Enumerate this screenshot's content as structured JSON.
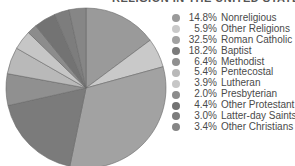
{
  "chart_data": {
    "type": "pie",
    "title": "RELIGION IN THE UNITED STATES",
    "legend_position": "right",
    "start_angle": "12 o'clock, clockwise",
    "slices": [
      {
        "label": "Nonreligious",
        "value": 14.8,
        "value_label": "14.8%",
        "color": "#9a9a9a"
      },
      {
        "label": "Other Religions",
        "value": 5.9,
        "value_label": "5.9%",
        "color": "#c9c9c9"
      },
      {
        "label": "Roman Catholic",
        "value": 32.5,
        "value_label": "32.5%",
        "color": "#a2a2a2"
      },
      {
        "label": "Baptist",
        "value": 18.2,
        "value_label": "18.2%",
        "color": "#7b7b7b"
      },
      {
        "label": "Methodist",
        "value": 6.4,
        "value_label": "6.4%",
        "color": "#909090"
      },
      {
        "label": "Pentecostal",
        "value": 5.4,
        "value_label": "5.4%",
        "color": "#b9b9b9"
      },
      {
        "label": "Lutheran",
        "value": 3.9,
        "value_label": "3.9%",
        "color": "#c6c6c6"
      },
      {
        "label": "Presbyterian",
        "value": 2.0,
        "value_label": "2.0%",
        "color": "#8c8c8c"
      },
      {
        "label": "Other Protestant",
        "value": 4.4,
        "value_label": "4.4%",
        "color": "#737373"
      },
      {
        "label": "Latter-day Saints",
        "value": 3.0,
        "value_label": "3.0%",
        "color": "#7d7d7d"
      },
      {
        "label": "Other Christians",
        "value": 3.4,
        "value_label": "3.4%",
        "color": "#868686"
      }
    ]
  }
}
